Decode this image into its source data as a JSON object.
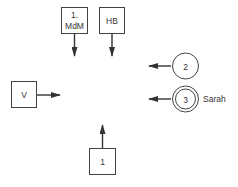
{
  "diagram": {
    "boxes": [
      {
        "id": "mdm",
        "line1": "1.",
        "line2": "MdM"
      },
      {
        "id": "hb",
        "label": "HB"
      },
      {
        "id": "v",
        "label": "V"
      },
      {
        "id": "one",
        "label": "1"
      }
    ],
    "circles": [
      {
        "id": "two",
        "label": "2",
        "double": false
      },
      {
        "id": "three",
        "label": "3",
        "double": true,
        "side_label": "Sarah"
      }
    ],
    "colors": {
      "stroke": "#333333",
      "background": "#ffffff"
    }
  }
}
